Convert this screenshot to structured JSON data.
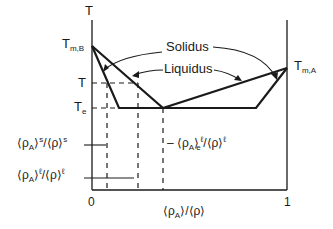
{
  "diagram": {
    "type": "binary eutectic phase diagram",
    "axes": {
      "y_label": "T",
      "x_label_num": "⟨ρ",
      "x_label_num_sub": "A",
      "x_label_rest": "⟩/⟨ρ⟩",
      "x_min_label": "0",
      "x_max_label": "1"
    },
    "temperature_labels": {
      "tmb_main": "T",
      "tmb_sub": "m,B",
      "tma_main": "T",
      "tma_sub": "m,A",
      "t": "T",
      "te_main": "T",
      "te_sub": "e"
    },
    "curve_labels": {
      "solidus": "Solidus",
      "liquidus": "Liquidus"
    },
    "composition_labels": {
      "solid": {
        "a": "⟨ρ",
        "sub": "A",
        "b": "⟩",
        "sup": "s",
        "c": "/⟨ρ⟩",
        "sup2": "s"
      },
      "liquid": {
        "a": "⟨ρ",
        "sub": "A",
        "b": "⟩",
        "sup": "ℓ",
        "c": "/⟨ρ⟩",
        "sup2": "ℓ"
      },
      "eutectic_liquid": {
        "dash": "– ⟨ρ",
        "sub": "A",
        "b": "⟩",
        "subE": "e",
        "sup": "ℓ",
        "c": "/⟨ρ⟩",
        "sup2": "ℓ"
      }
    },
    "colors": {
      "line": "#1a1a1a",
      "background": "#ffffff"
    }
  }
}
